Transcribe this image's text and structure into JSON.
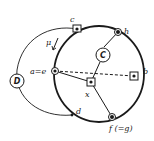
{
  "diagram": {
    "labels": {
      "c": "c",
      "h": "h",
      "ae": "a=e",
      "b": "b",
      "x": "x",
      "d": "d",
      "f": "f (=g)",
      "mu": "μ",
      "D": "D",
      "C": "C"
    },
    "nodes": [
      {
        "id": "c",
        "marker": "square"
      },
      {
        "id": "h",
        "marker": "circle"
      },
      {
        "id": "a=e",
        "marker": "circle"
      },
      {
        "id": "b",
        "marker": "square"
      },
      {
        "id": "x",
        "marker": "square"
      },
      {
        "id": "f(=g)",
        "marker": "circle"
      },
      {
        "id": "d",
        "marker": "dot"
      }
    ],
    "regions": [
      {
        "id": "D",
        "boundary": "thin-ellipse"
      },
      {
        "id": "C",
        "boundary": "bold-ellipse"
      }
    ],
    "edges": [
      {
        "from": "a=e",
        "to": "x",
        "style": "solid"
      },
      {
        "from": "x",
        "to": "C",
        "style": "solid"
      },
      {
        "from": "C",
        "to": "h",
        "style": "solid"
      },
      {
        "from": "x",
        "to": "f(=g)",
        "style": "solid"
      },
      {
        "from": "a=e",
        "to": "b",
        "style": "dashed"
      }
    ],
    "colors": {
      "ink": "#1a1a1a",
      "background": "#ffffff"
    }
  }
}
